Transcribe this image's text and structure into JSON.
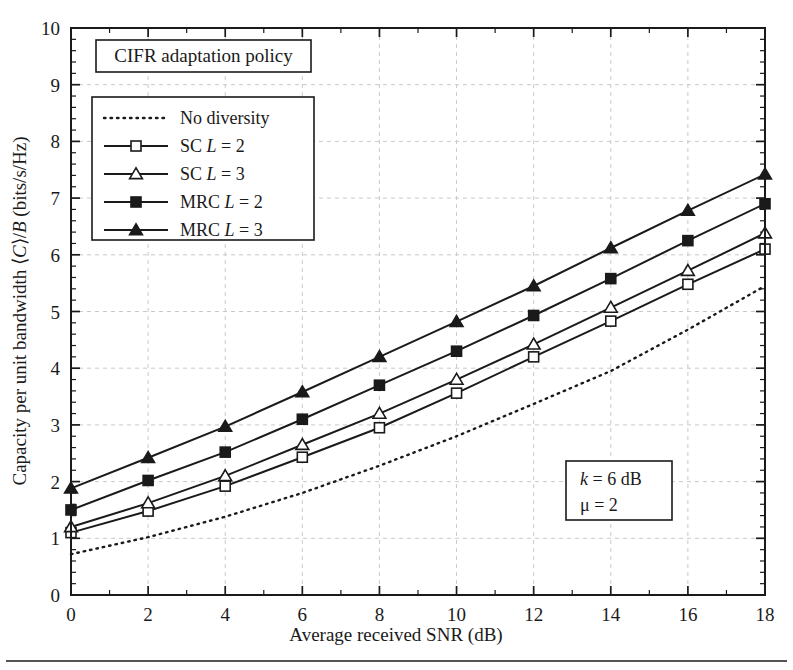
{
  "figure": {
    "title_box": "CIFR adaptation policy",
    "annotation_box": {
      "line1": "k = 6 dB",
      "line2": "μ = 2"
    }
  },
  "chart_data": {
    "type": "line",
    "title": "CIFR adaptation policy",
    "xlabel": "Average received SNR (dB)",
    "ylabel": "Capacity per unit bandwidth ⟨C⟩/B (bits/s/Hz)",
    "xlim": [
      0,
      18
    ],
    "ylim": [
      0,
      10
    ],
    "xticks": [
      0,
      2,
      4,
      6,
      8,
      10,
      12,
      14,
      16,
      18
    ],
    "yticks": [
      0,
      1,
      2,
      3,
      4,
      5,
      6,
      7,
      8,
      9,
      10
    ],
    "x_minor_step": 1,
    "y_minor_step": 0.2,
    "grid": true,
    "grid_style": "dashed light gray at major ticks",
    "legend_position": "upper left inside axes",
    "annotations": [
      {
        "text": "CIFR adaptation policy",
        "position": "top-left inside axes"
      },
      {
        "text": "k = 6 dB",
        "position": "lower-right inside axes"
      },
      {
        "text": "μ = 2",
        "position": "lower-right inside axes"
      }
    ],
    "x": [
      0,
      2,
      4,
      6,
      8,
      10,
      12,
      14,
      16,
      18
    ],
    "series": [
      {
        "name": "No diversity",
        "marker": "none",
        "linestyle": "dotted",
        "values": [
          0.72,
          1.02,
          1.38,
          1.8,
          2.28,
          2.8,
          3.37,
          3.95,
          4.68,
          5.45
        ]
      },
      {
        "name": "SC L = 2",
        "marker": "open-square",
        "linestyle": "solid",
        "values": [
          1.1,
          1.48,
          1.92,
          2.43,
          2.95,
          3.56,
          4.2,
          4.83,
          5.48,
          6.1
        ]
      },
      {
        "name": "SC L = 3",
        "marker": "open-triangle",
        "linestyle": "solid",
        "values": [
          1.2,
          1.62,
          2.1,
          2.65,
          3.2,
          3.8,
          4.42,
          5.07,
          5.72,
          6.38
        ]
      },
      {
        "name": "MRC L = 2",
        "marker": "filled-square",
        "linestyle": "solid",
        "values": [
          1.5,
          2.02,
          2.52,
          3.1,
          3.7,
          4.3,
          4.93,
          5.58,
          6.25,
          6.9
        ]
      },
      {
        "name": "MRC L = 3",
        "marker": "filled-triangle",
        "linestyle": "solid",
        "values": [
          1.88,
          2.42,
          2.97,
          3.58,
          4.2,
          4.82,
          5.45,
          6.12,
          6.78,
          7.42
        ]
      }
    ]
  },
  "legend": {
    "entries": [
      {
        "label": "No diversity",
        "label_prefix": "No diversity",
        "label_var": "",
        "label_suffix": ""
      },
      {
        "label": "SC L = 2",
        "label_prefix": "SC ",
        "label_var": "L",
        "label_suffix": " = 2"
      },
      {
        "label": "SC L = 3",
        "label_prefix": "SC ",
        "label_var": "L",
        "label_suffix": " = 3"
      },
      {
        "label": "MRC L = 2",
        "label_prefix": "MRC ",
        "label_var": "L",
        "label_suffix": " = 2"
      },
      {
        "label": "MRC L = 3",
        "label_prefix": "MRC ",
        "label_var": "L",
        "label_suffix": " = 3"
      }
    ]
  },
  "axes": {
    "x_title": "Average received SNR (dB)",
    "y_title_parts": {
      "p1": "Capacity per unit bandwidth ⟨",
      "v1": "C",
      "p2": "⟩/",
      "v2": "B",
      "p3": " (bits/s/Hz)"
    },
    "x_tick_labels": [
      "0",
      "2",
      "4",
      "6",
      "8",
      "10",
      "12",
      "14",
      "16",
      "18"
    ],
    "y_tick_labels": [
      "0",
      "1",
      "2",
      "3",
      "4",
      "5",
      "6",
      "7",
      "8",
      "9",
      "10"
    ]
  },
  "colors": {
    "ink": "#1a1a1a",
    "grid": "#c9c9c9",
    "background": "#ffffff"
  }
}
